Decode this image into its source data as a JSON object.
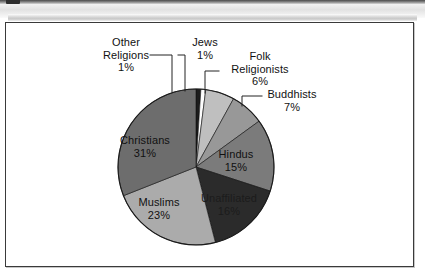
{
  "figure": {
    "background_color": "#ffffff",
    "border_color": "#3a3a3a"
  },
  "chart_data": {
    "type": "pie",
    "title": "",
    "subtitle": "",
    "xlabel": "",
    "ylabel": "",
    "legend_position": "none",
    "grid": false,
    "units": "percent",
    "total": 100,
    "start_angle_deg": 0,
    "direction": "clockwise",
    "categories": [
      "Other Religions",
      "Jews",
      "Folk Religionists",
      "Buddhists",
      "Hindus",
      "Unaffiliated",
      "Muslims",
      "Christians"
    ],
    "values": [
      1,
      1,
      6,
      7,
      15,
      16,
      23,
      31
    ],
    "slice_colors": [
      "#1c1c1c",
      "#fdfdfd",
      "#bfbfbf",
      "#989898",
      "#7b7b7b",
      "#2b2b2b",
      "#ababab",
      "#6d6d6d"
    ],
    "slices": [
      {
        "label": "Other Religions",
        "value": 1,
        "value_text": "1%",
        "color": "#1c1c1c",
        "label_placement": "outside"
      },
      {
        "label": "Jews",
        "value": 1,
        "value_text": "1%",
        "color": "#fdfdfd",
        "label_placement": "outside"
      },
      {
        "label": "Folk Religionists",
        "value": 6,
        "value_text": "6%",
        "color": "#bfbfbf",
        "label_placement": "outside"
      },
      {
        "label": "Buddhists",
        "value": 7,
        "value_text": "7%",
        "color": "#989898",
        "label_placement": "outside"
      },
      {
        "label": "Hindus",
        "value": 15,
        "value_text": "15%",
        "color": "#7b7b7b",
        "label_placement": "inside"
      },
      {
        "label": "Unaffiliated",
        "value": 16,
        "value_text": "16%",
        "color": "#2b2b2b",
        "label_placement": "inside"
      },
      {
        "label": "Muslims",
        "value": 23,
        "value_text": "23%",
        "color": "#ababab",
        "label_placement": "inside"
      },
      {
        "label": "Christians",
        "value": 31,
        "value_text": "31%",
        "color": "#6d6d6d",
        "label_placement": "inside"
      }
    ]
  },
  "labels": {
    "other_religions": {
      "line1": "Other",
      "line2": "Religions",
      "pct": "1%"
    },
    "jews": {
      "line1": "Jews",
      "pct": "1%"
    },
    "folk": {
      "line1": "Folk",
      "line2": "Religionists",
      "pct": "6%"
    },
    "buddhists": {
      "line1": "Buddhists",
      "pct": "7%"
    },
    "hindus": {
      "line1": "Hindus",
      "pct": "15%"
    },
    "unaffiliated": {
      "line1": "Unaffiliated",
      "pct": "16%"
    },
    "muslims": {
      "line1": "Muslims",
      "pct": "23%"
    },
    "christians": {
      "line1": "Christians",
      "pct": "31%"
    }
  }
}
